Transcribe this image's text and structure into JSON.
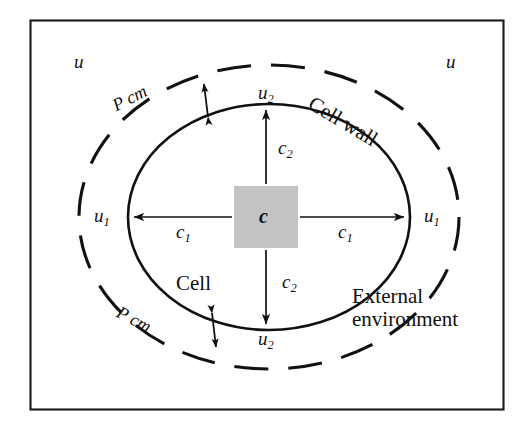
{
  "figure": {
    "colors": {
      "ink": "#111111",
      "frame": "#1a1a1a",
      "membrane": "#111111",
      "wall_dash": "#111111",
      "source_fill": "#c3c3c3",
      "background": "#ffffff"
    },
    "frame": {
      "x": 30,
      "y": 20,
      "width": 474,
      "height": 390
    },
    "outer_ellipse": {
      "cx": 269,
      "cy": 217,
      "rx": 190,
      "ry": 152,
      "style": "dashed"
    },
    "inner_ellipse": {
      "cx": 269,
      "cy": 217,
      "rx": 141,
      "ry": 113,
      "style": "solid"
    },
    "source_square": {
      "x": 234,
      "y": 186,
      "width": 64,
      "height": 62
    }
  },
  "labels": {
    "u_top_left": "u",
    "u_top_right": "u",
    "u1_left": "u",
    "u1_left_sub": "1",
    "u1_right": "u",
    "u1_right_sub": "1",
    "u2_top": "u",
    "u2_top_sub": "2",
    "u2_bottom": "u",
    "u2_bottom_sub": "2",
    "c1_left": "c",
    "c1_left_sub": "1",
    "c1_right": "c",
    "c1_right_sub": "1",
    "c2_top": "c",
    "c2_top_sub": "2",
    "c2_bottom": "c",
    "c2_bottom_sub": "2",
    "c_centre": "c",
    "pcm_top": "P cm",
    "pcm_bottom": "P cm",
    "cell_wall": "Cell wall",
    "cell": "Cell",
    "external_environment_line1": "External",
    "external_environment_line2": "environment"
  }
}
